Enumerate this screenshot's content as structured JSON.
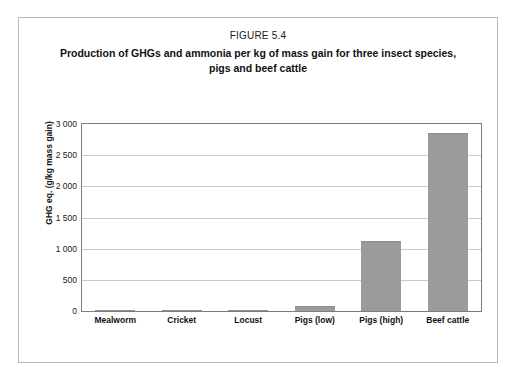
{
  "figure": {
    "number_label": "FIGURE 5.4",
    "caption": "Production of GHGs and ammonia per kg of mass gain for three insect species, pigs and beef cattle"
  },
  "chart_data": {
    "type": "bar",
    "title": "Production of GHGs and ammonia per kg of mass gain for three insect species, pigs and beef cattle",
    "subtitle": "FIGURE 5.4",
    "categories": [
      "Mealworm",
      "Cricket",
      "Locust",
      "Pigs (low)",
      "Pigs (high)",
      "Beef cattle"
    ],
    "values": [
      8,
      10,
      18,
      80,
      1130,
      2850
    ],
    "series": [
      {
        "name": "GHG eq.",
        "values": [
          8,
          10,
          18,
          80,
          1130,
          2850
        ]
      }
    ],
    "xlabel": "",
    "ylabel": "GHG eq. (g/kg mass gain)",
    "ylim": [
      0,
      3000
    ],
    "ytick_values": [
      0,
      500,
      1000,
      1500,
      2000,
      2500,
      3000
    ],
    "ytick_labels": [
      "0",
      "500",
      "1 000",
      "1 500",
      "2 000",
      "2 500",
      "3 000"
    ],
    "grid": "horizontal",
    "legend": "none",
    "bar_color": "#9a9b9b",
    "frame_color": "#7d7d7d",
    "gridline_color": "#c9c9c9"
  }
}
